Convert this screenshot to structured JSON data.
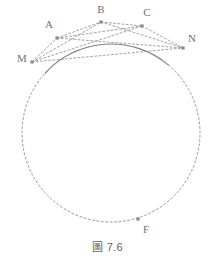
{
  "figure": {
    "caption": "圖 7.6",
    "colors": {
      "stroke": "#8a8a93",
      "solid_arc": "#7e7e88",
      "label": "#6f6f78",
      "vertex": "#8a8a93",
      "background": "#ffffff"
    },
    "circle": {
      "center_x": 111,
      "center_y": 133,
      "radius": 89,
      "solid_from_point": "M",
      "solid_to_point": "N",
      "dashed_remainder": true
    },
    "points": [
      {
        "id": "M",
        "label": "M",
        "x": 32,
        "y": 62,
        "label_x": 22,
        "label_y": 62
      },
      {
        "id": "A",
        "label": "A",
        "x": 57,
        "y": 38,
        "label_x": 49,
        "label_y": 28
      },
      {
        "id": "B",
        "label": "B",
        "x": 101,
        "y": 22,
        "label_x": 101,
        "label_y": 13
      },
      {
        "id": "C",
        "label": "C",
        "x": 142,
        "y": 26,
        "label_x": 147,
        "label_y": 16
      },
      {
        "id": "N",
        "label": "N",
        "x": 183,
        "y": 48,
        "label_x": 192,
        "label_y": 42
      },
      {
        "id": "F",
        "label": "F",
        "x": 138,
        "y": 219,
        "label_x": 146,
        "label_y": 233
      }
    ],
    "chords": [
      {
        "from": "M",
        "to": "A",
        "style": "dashed"
      },
      {
        "from": "M",
        "to": "B",
        "style": "dashed"
      },
      {
        "from": "M",
        "to": "C",
        "style": "dashed"
      },
      {
        "from": "M",
        "to": "N",
        "style": "dashed"
      },
      {
        "from": "A",
        "to": "B",
        "style": "dashed"
      },
      {
        "from": "A",
        "to": "C",
        "style": "dashed"
      },
      {
        "from": "A",
        "to": "N",
        "style": "dashed"
      },
      {
        "from": "B",
        "to": "C",
        "style": "dashed"
      },
      {
        "from": "B",
        "to": "N",
        "style": "dashed"
      },
      {
        "from": "C",
        "to": "N",
        "style": "dashed"
      }
    ]
  }
}
